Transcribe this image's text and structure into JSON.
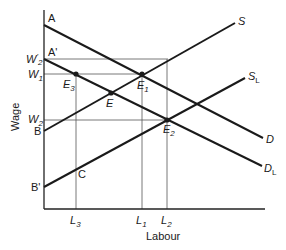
{
  "diagram": {
    "type": "labour-market supply-demand",
    "axes": {
      "x_label": "Labour",
      "y_label": "Wage"
    },
    "y_axis_labels": {
      "A": "A",
      "A_prime": "A'",
      "W2_prime": "W'2",
      "W1": "W1",
      "W2": "W2",
      "B": "B",
      "B_prime": "B'"
    },
    "x_axis_labels": {
      "L3": "L3",
      "L1": "L1",
      "L2": "L2"
    },
    "curves": {
      "S": "S",
      "SL": "SL",
      "D": "D",
      "DL": "DL"
    },
    "points": {
      "E": "E",
      "E1": "E1",
      "E2": "E2",
      "E3": "E3",
      "C": "C"
    },
    "colors": {
      "line": "#1a1a1a",
      "guide": "#555555",
      "background": "#ffffff"
    }
  }
}
